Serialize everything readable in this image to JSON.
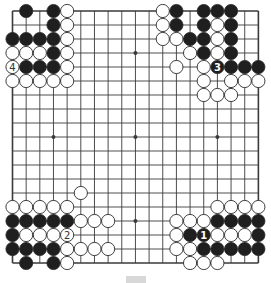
{
  "board": {
    "size": 19,
    "origin_x": 12.5,
    "origin_y": 11,
    "step_x": 13.66,
    "step_y": 14.0,
    "stone_radius": 6.6,
    "colors": {
      "background": "#ffffff",
      "line": "#3a3a3a",
      "black_stone": "#1f1f1f",
      "white_stone": "#ffffff",
      "stone_outline": "#2a2a2a"
    },
    "star_points": [
      [
        3,
        3
      ],
      [
        9,
        3
      ],
      [
        15,
        3
      ],
      [
        3,
        9
      ],
      [
        9,
        9
      ],
      [
        15,
        9
      ],
      [
        3,
        15
      ],
      [
        9,
        15
      ],
      [
        15,
        15
      ]
    ],
    "black_stones": [
      [
        1,
        0
      ],
      [
        3,
        0
      ],
      [
        3,
        1
      ],
      [
        0,
        2
      ],
      [
        1,
        2
      ],
      [
        2,
        2
      ],
      [
        3,
        2
      ],
      [
        3,
        3
      ],
      [
        1,
        4
      ],
      [
        2,
        4
      ],
      [
        3,
        4
      ],
      [
        12,
        0
      ],
      [
        14,
        0
      ],
      [
        15,
        0
      ],
      [
        16,
        0
      ],
      [
        12,
        1
      ],
      [
        14,
        1
      ],
      [
        16,
        1
      ],
      [
        13,
        2
      ],
      [
        14,
        2
      ],
      [
        16,
        2
      ],
      [
        14,
        3
      ],
      [
        16,
        3
      ],
      [
        15,
        4
      ],
      [
        16,
        4
      ],
      [
        17,
        4
      ],
      [
        18,
        4
      ],
      [
        0,
        15
      ],
      [
        1,
        15
      ],
      [
        2,
        15
      ],
      [
        3,
        15
      ],
      [
        4,
        15
      ],
      [
        0,
        16
      ],
      [
        0,
        17
      ],
      [
        1,
        17
      ],
      [
        2,
        17
      ],
      [
        3,
        17
      ],
      [
        1,
        18
      ],
      [
        3,
        18
      ],
      [
        15,
        15
      ],
      [
        16,
        15
      ],
      [
        17,
        15
      ],
      [
        18,
        15
      ],
      [
        13,
        16
      ],
      [
        14,
        16
      ],
      [
        18,
        16
      ],
      [
        14,
        17
      ],
      [
        15,
        17
      ],
      [
        16,
        17
      ],
      [
        17,
        17
      ],
      [
        18,
        17
      ]
    ],
    "white_stones": [
      [
        4,
        0
      ],
      [
        4,
        1
      ],
      [
        4,
        2
      ],
      [
        0,
        3
      ],
      [
        1,
        3
      ],
      [
        2,
        3
      ],
      [
        4,
        3
      ],
      [
        0,
        4
      ],
      [
        4,
        4
      ],
      [
        0,
        5
      ],
      [
        1,
        5
      ],
      [
        2,
        5
      ],
      [
        3,
        5
      ],
      [
        4,
        5
      ],
      [
        11,
        0
      ],
      [
        11,
        1
      ],
      [
        11,
        2
      ],
      [
        12,
        2
      ],
      [
        15,
        1
      ],
      [
        15,
        2
      ],
      [
        13,
        3
      ],
      [
        15,
        3
      ],
      [
        12,
        4
      ],
      [
        14,
        4
      ],
      [
        14,
        5
      ],
      [
        16,
        5
      ],
      [
        17,
        5
      ],
      [
        18,
        5
      ],
      [
        14,
        6
      ],
      [
        15,
        6
      ],
      [
        16,
        6
      ],
      [
        5,
        13
      ],
      [
        0,
        14
      ],
      [
        1,
        14
      ],
      [
        2,
        14
      ],
      [
        3,
        14
      ],
      [
        4,
        14
      ],
      [
        5,
        15
      ],
      [
        6,
        15
      ],
      [
        7,
        15
      ],
      [
        1,
        16
      ],
      [
        2,
        16
      ],
      [
        3,
        16
      ],
      [
        4,
        16
      ],
      [
        4,
        17
      ],
      [
        5,
        17
      ],
      [
        6,
        17
      ],
      [
        7,
        17
      ],
      [
        4,
        18
      ],
      [
        15,
        14
      ],
      [
        16,
        14
      ],
      [
        17,
        14
      ],
      [
        18,
        14
      ],
      [
        12,
        15
      ],
      [
        13,
        15
      ],
      [
        14,
        15
      ],
      [
        12,
        16
      ],
      [
        15,
        16
      ],
      [
        16,
        16
      ],
      [
        17,
        16
      ],
      [
        12,
        17
      ],
      [
        13,
        17
      ],
      [
        13,
        18
      ],
      [
        14,
        18
      ],
      [
        15,
        18
      ]
    ],
    "numbered_moves": [
      {
        "label": "1",
        "color": "black",
        "col": 14,
        "row": 16
      },
      {
        "label": "2",
        "color": "white",
        "col": 4,
        "row": 16
      },
      {
        "label": "3",
        "color": "black",
        "col": 15,
        "row": 4
      },
      {
        "label": "4",
        "color": "white",
        "col": 0,
        "row": 4
      }
    ]
  }
}
